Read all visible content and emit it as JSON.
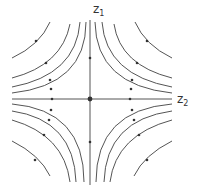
{
  "diagram": {
    "type": "phase-portrait-saddle",
    "axes": {
      "vertical_label": "z",
      "vertical_sub": "1",
      "horizontal_label": "z",
      "horizontal_sub": "2"
    },
    "colors": {
      "line": "#555555",
      "background": "#ffffff"
    }
  }
}
